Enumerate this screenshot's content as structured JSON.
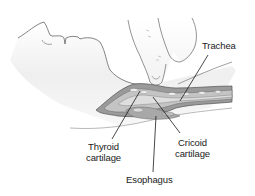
{
  "figure": {
    "colors": {
      "line": "#555555",
      "skin_shade": "#e9e9e9",
      "tissue_dark": "#8a8a8a",
      "tissue_mid": "#b4b4b4",
      "tissue_light": "#d2d2d2",
      "cartilage": "#ececec",
      "leader": "#1a1a1a"
    }
  },
  "labels": {
    "trachea": {
      "line1": "Trachea"
    },
    "thyroid_cartilage": {
      "line1": "Thyroid",
      "line2": "cartilage"
    },
    "cricoid_cartilage": {
      "line1": "Cricoid",
      "line2": "cartilage"
    },
    "esophagus": {
      "line1": "Esophagus"
    }
  }
}
